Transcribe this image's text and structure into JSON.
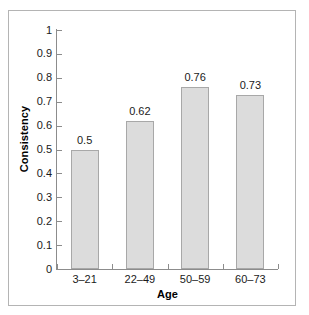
{
  "chart_data": {
    "type": "bar",
    "title": "",
    "xlabel": "Age",
    "ylabel": "Consistency",
    "categories": [
      "3–21",
      "22–49",
      "50–59",
      "60–73"
    ],
    "values": [
      0.5,
      0.62,
      0.76,
      0.73
    ],
    "value_labels": [
      "0.5",
      "0.62",
      "0.76",
      "0.73"
    ],
    "ylim": [
      0,
      1
    ],
    "ytick_labels": [
      "0",
      "0.1",
      "0.2",
      "0.3",
      "0.4",
      "0.5",
      "0.6",
      "0.7",
      "0.8",
      "0.9",
      "1"
    ],
    "ytick_values": [
      0,
      0.1,
      0.2,
      0.3,
      0.4,
      0.5,
      0.6,
      0.7,
      0.8,
      0.9,
      1
    ],
    "grid": false,
    "legend": false,
    "bar_fill_color": "#dcdcdc",
    "bar_border_color": "#a8a8a8",
    "axis_color": "#8c8c8c",
    "background_color": "#ffffff",
    "frame_border_color": "#b4b4b4"
  }
}
